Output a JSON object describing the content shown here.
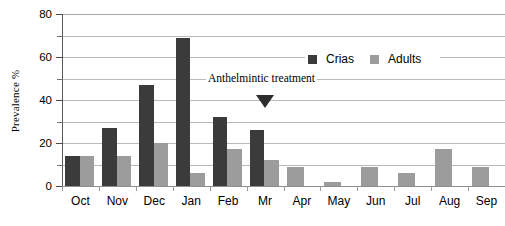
{
  "chart_data": {
    "type": "bar",
    "title": "",
    "xlabel": "",
    "ylabel": "Prevalence  %",
    "ylim": [
      0,
      80
    ],
    "ytick_values": [
      0,
      20,
      40,
      60,
      80
    ],
    "ytick_labels": [
      "0",
      "20",
      "40",
      "60",
      "80"
    ],
    "yminor_values": [
      10,
      30,
      50,
      70
    ],
    "gridlines": [
      10,
      20,
      30,
      40,
      50,
      60,
      70,
      80
    ],
    "grid": true,
    "legend_position": "upper-right-inside",
    "categories": [
      "Oct",
      "Nov",
      "Dec",
      "Jan",
      "Feb",
      "Mr",
      "Apr",
      "May",
      "Jun",
      "Jul",
      "Aug",
      "Sep"
    ],
    "series": [
      {
        "name": "Crias",
        "color": "#3b3b3b",
        "values": [
          14,
          27,
          47,
          69,
          32,
          26,
          null,
          null,
          null,
          null,
          null,
          null
        ]
      },
      {
        "name": "Adults",
        "color": "#9c9c9c",
        "values": [
          14,
          14,
          20,
          6,
          17,
          12,
          9,
          2,
          9,
          6,
          17,
          9
        ]
      }
    ],
    "annotations": [
      {
        "text": "Anthelmintic treatment",
        "marker": "down-triangle",
        "marker_category": "Mr",
        "marker_value": 40
      }
    ]
  },
  "legend": {
    "entries": [
      {
        "label": "Crias",
        "color": "#3b3b3b"
      },
      {
        "label": "Adults",
        "color": "#9c9c9c"
      }
    ]
  },
  "annotation": {
    "text": "Anthelmintic treatment"
  }
}
